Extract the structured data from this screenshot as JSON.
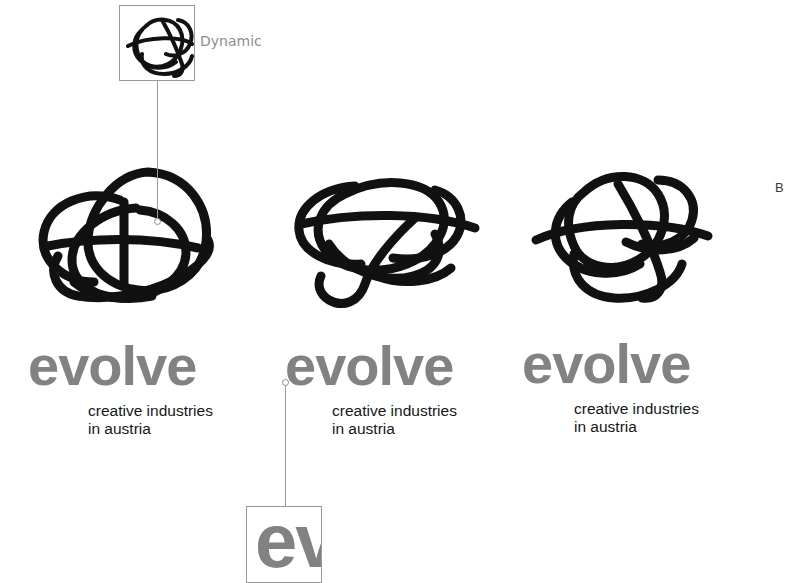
{
  "canvas": {
    "width": 785,
    "height": 583,
    "background": "#ffffff"
  },
  "colors": {
    "wordmark_gray": "#828282",
    "tagline_black": "#161616",
    "scribble_black": "#111111",
    "callout_border": "#9a9a9a",
    "leader_line": "#9a9a9a",
    "label_gray": "#8e8e8e"
  },
  "logos": [
    {
      "id": "logo-variant-1",
      "wordmark": "evolve",
      "tagline": "creative industries\nin austria",
      "mark_name": "scribble-mark-round"
    },
    {
      "id": "logo-variant-2",
      "wordmark": "evolve",
      "tagline": "creative industries\nin austria",
      "mark_name": "scribble-mark-wide"
    },
    {
      "id": "logo-variant-3",
      "wordmark": "evolve",
      "tagline": "creative industries\nin austria",
      "mark_name": "scribble-mark-looped"
    }
  ],
  "callouts": [
    {
      "id": "callout-dynamic",
      "label": "Dynamic",
      "content_kind": "scribble-mark-thumbnail"
    },
    {
      "id": "callout-wordmark-detail",
      "label": "",
      "content_kind": "wordmark-crop",
      "content_text": "ev"
    }
  ],
  "edge_label": {
    "text": "B"
  }
}
